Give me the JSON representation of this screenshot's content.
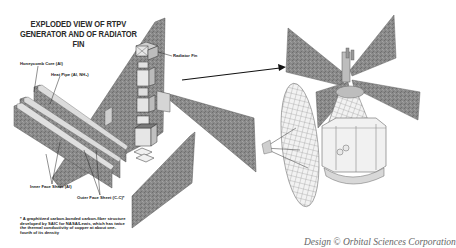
{
  "diagram": {
    "title": "EXPLODED VIEW OF RTPV GENERATOR AND OF RADIATOR FIN",
    "labels": {
      "honeycomb_core": "Honeycomb Core (Al)",
      "heat_pipe": "Heat Pipe (Al, NH₃)",
      "radiator_fin": "Radiator Fin",
      "inner_face_sheet": "Inner Face Sheet (Al)",
      "outer_face_sheet": "Outer Face Sheet (C-C)*"
    },
    "footnote": "* A graphitized carbon-bonded carbon-fiber structure developed by SAIC for NASA/Lewis, which has twice the thermal conductivity of copper at about one-fourth of its density",
    "credit": "Design © Orbital Sciences Corporation",
    "colors": {
      "panel_fill": "#8c8c8c",
      "panel_edge": "#5a5a5a",
      "light_part": "#d9d9d9",
      "line": "#111111",
      "background": "#ffffff"
    }
  }
}
